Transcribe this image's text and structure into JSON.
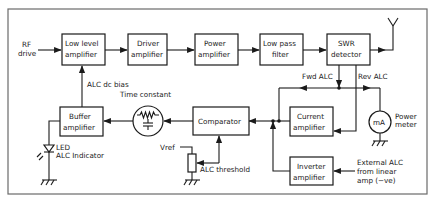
{
  "diagram": {
    "colors": {
      "line": "#1a1a1a",
      "frame": "#6a6a6a",
      "background": "#ffffff"
    },
    "inputs": {
      "rf_drive": [
        "RF",
        "drive"
      ],
      "external_alc": [
        "External ALC",
        "from linear",
        "amp (−ve)"
      ]
    },
    "blocks": {
      "low_level_amplifier": [
        "Low level",
        "amplifier"
      ],
      "driver_amplifier": [
        "Driver",
        "amplifier"
      ],
      "power_amplifier": [
        "Power",
        "amplifier"
      ],
      "low_pass_filter": [
        "Low pass",
        "filter"
      ],
      "swr_detector": [
        "SWR",
        "detector"
      ],
      "buffer_amplifier": [
        "Buffer",
        "amplifier"
      ],
      "comparator": "Comparator",
      "current_amplifier": [
        "Current",
        "amplifier"
      ],
      "inverter_amplifier": [
        "Inverter",
        "amplifier"
      ]
    },
    "labels": {
      "alc_dc_bias": "ALC dc bias",
      "time_constant": "Time constant",
      "fwd_alc": "Fwd ALC",
      "rev_alc": "Rev ALC",
      "power_meter": [
        "Power",
        "meter"
      ],
      "meter_unit": "mA",
      "vref": "Vref",
      "alc_threshold": "ALC threshold",
      "led": [
        "LED",
        "ALC Indicator"
      ]
    }
  }
}
